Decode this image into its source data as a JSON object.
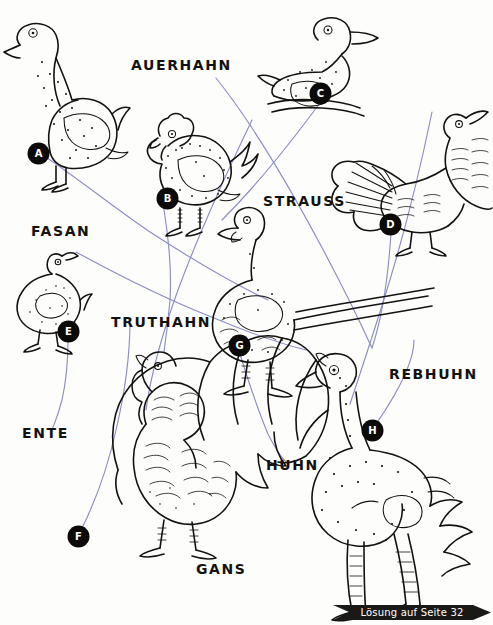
{
  "worksheet": {
    "language": "de",
    "type": "matching-puzzle",
    "subject": "Vögel / Geflügel"
  },
  "labels": [
    {
      "id": "auerhahn",
      "text": "AUERHAHN",
      "x": 131,
      "y": 58
    },
    {
      "id": "strauss",
      "text": "STRAUSS",
      "x": 263,
      "y": 194
    },
    {
      "id": "fasan",
      "text": "FASAN",
      "x": 31,
      "y": 224
    },
    {
      "id": "truthahn",
      "text": "TRUTHAHN",
      "x": 111,
      "y": 315
    },
    {
      "id": "rebhuhn",
      "text": "REBHUHN",
      "x": 389,
      "y": 367
    },
    {
      "id": "ente",
      "text": "ENTE",
      "x": 22,
      "y": 426
    },
    {
      "id": "huhn",
      "text": "HUHN",
      "x": 266,
      "y": 458
    },
    {
      "id": "gans",
      "text": "GANS",
      "x": 196,
      "y": 562
    }
  ],
  "badges": [
    {
      "letter": "A",
      "x": 29,
      "y": 144,
      "bird": "goose"
    },
    {
      "letter": "B",
      "x": 158,
      "y": 189,
      "bird": "chicken"
    },
    {
      "letter": "C",
      "x": 320,
      "y": 93,
      "bird": "duck"
    },
    {
      "letter": "D",
      "x": 390,
      "y": 224,
      "bird": "capercaillie"
    },
    {
      "letter": "E",
      "x": 68,
      "y": 331,
      "bird": "partridge"
    },
    {
      "letter": "F",
      "x": 78,
      "y": 536,
      "bird": "turkey"
    },
    {
      "letter": "G",
      "x": 239,
      "y": 345,
      "bird": "pheasant"
    },
    {
      "letter": "H",
      "x": 372,
      "y": 430,
      "bird": "ostrich"
    }
  ],
  "connections": [
    {
      "from": "A",
      "to": "fasan"
    },
    {
      "from": "B",
      "to": "truthahn"
    },
    {
      "from": "C",
      "to": "strauss"
    },
    {
      "from": "D",
      "to": "auerhahn"
    },
    {
      "from": "E",
      "to": "ente"
    },
    {
      "from": "F",
      "to": "gans"
    },
    {
      "from": "G",
      "to": "huhn"
    },
    {
      "from": "H",
      "to": "rebhuhn"
    }
  ],
  "answer_banner": {
    "text": "Lösung auf Seite 32"
  },
  "colors": {
    "ink": "#14120f",
    "line": "#8c8ec4",
    "badge_bg": "#0d0b0a",
    "badge_text": "#ffffff",
    "banner_bg": "#1b1916",
    "paper": "#fdfdfc"
  }
}
